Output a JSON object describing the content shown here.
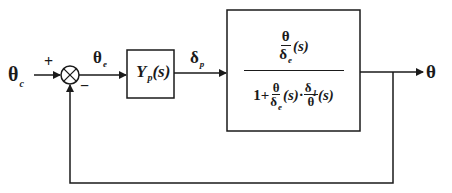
{
  "diagram": {
    "type": "feedback-control-block-diagram",
    "input": {
      "symbol": "θ",
      "subscript": "c"
    },
    "summing_junction": {
      "plus_sign": "+",
      "minus_sign": "−"
    },
    "error_signal": {
      "symbol": "θ",
      "subscript": "e"
    },
    "controller_block": {
      "name": "Y",
      "subscript": "p",
      "arg": "(s)"
    },
    "controller_output": {
      "symbol": "δ",
      "subscript": "p"
    },
    "plant_block": {
      "numerator": {
        "frac_num": "θ",
        "frac_den_symbol": "δ",
        "frac_den_sub": "e",
        "arg": "(s)"
      },
      "denominator": {
        "one_plus": "1+",
        "term1_num": "θ",
        "term1_den_symbol": "δ",
        "term1_den_sub": "e",
        "term1_arg": "(s)",
        "dot": "·",
        "term2_num_symbol": "δ",
        "term2_num_sub": "1",
        "term2_den": "θ",
        "term2_arg": "(s)"
      }
    },
    "output": {
      "symbol": "θ"
    },
    "feedback": "unity negative feedback from output to summing junction"
  }
}
